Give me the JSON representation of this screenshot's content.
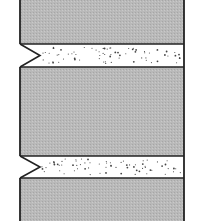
{
  "diagram": {
    "colors": {
      "background": "#ffffff",
      "block_fill": "#b9b9b9",
      "band_fill": "#ffffff",
      "outline": "#222222",
      "dots": "#444444"
    },
    "frame": {
      "left": 20,
      "right": 184,
      "top": 0,
      "bottom": 221
    },
    "blocks": [
      {
        "id": "top-block",
        "top": 0,
        "bottom": 44
      },
      {
        "id": "middle-block",
        "top": 67,
        "bottom": 156
      },
      {
        "id": "bottom-block",
        "top": 178,
        "bottom": 221
      }
    ],
    "bands": [
      {
        "id": "upper-band",
        "top": 44,
        "bottom": 67,
        "notch_apex_x": 40
      },
      {
        "id": "lower-band",
        "top": 156,
        "bottom": 178,
        "notch_apex_x": 40
      }
    ]
  }
}
